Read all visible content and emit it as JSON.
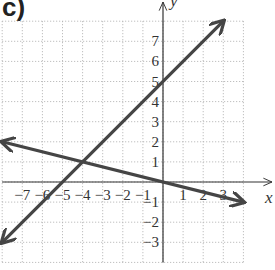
{
  "figure_label": "c)",
  "chart_data": {
    "type": "line",
    "title": "",
    "xlabel": "x",
    "ylabel": "y",
    "xlim": [
      -8,
      4
    ],
    "ylim": [
      -4,
      8
    ],
    "grid": true,
    "x_ticks": [
      -7,
      -6,
      -5,
      -4,
      -3,
      -2,
      -1,
      1,
      2,
      3
    ],
    "y_ticks": [
      -3,
      -2,
      -1,
      1,
      2,
      3,
      4,
      5,
      6,
      7
    ],
    "series": [
      {
        "name": "line-1",
        "equation": "y = x + 5",
        "x": [
          -8,
          3
        ],
        "y": [
          -3,
          8
        ],
        "points_marked": [
          [
            -5,
            0
          ],
          [
            0,
            5
          ]
        ],
        "arrows": "both"
      },
      {
        "name": "line-2",
        "equation": "y = -x/4",
        "x": [
          -8,
          4
        ],
        "y": [
          2,
          -1
        ],
        "points_marked": [
          [
            -4,
            1
          ],
          [
            0,
            0
          ]
        ],
        "arrows": "both"
      }
    ],
    "intersection": [
      -4,
      1
    ]
  },
  "colors": {
    "line": "#454545",
    "axis": "#333333",
    "grid": "#b0b0b0"
  }
}
